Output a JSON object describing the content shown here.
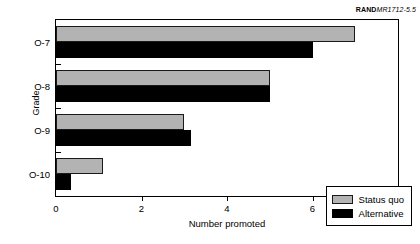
{
  "credit": {
    "brand": "RAND",
    "document_id": "MR1712-5.5"
  },
  "chart_data": {
    "type": "bar",
    "orientation": "horizontal",
    "title": "",
    "xlabel": "Number promoted",
    "ylabel": "Grade",
    "categories": [
      "O-7",
      "O-8",
      "O-9",
      "O-10"
    ],
    "series": [
      {
        "name": "Status quo",
        "color": "#b3b3b3",
        "values": [
          7.0,
          5.0,
          3.0,
          1.1
        ]
      },
      {
        "name": "Alternative",
        "color": "#000000",
        "values": [
          6.0,
          5.0,
          3.15,
          0.35
        ]
      }
    ],
    "xlim": [
      0,
      8
    ],
    "xticks": [
      "0",
      "2",
      "4",
      "6",
      "8"
    ],
    "xtick_values": [
      0,
      2,
      4,
      6,
      8
    ],
    "grid": false,
    "legend_position": "lower right"
  }
}
